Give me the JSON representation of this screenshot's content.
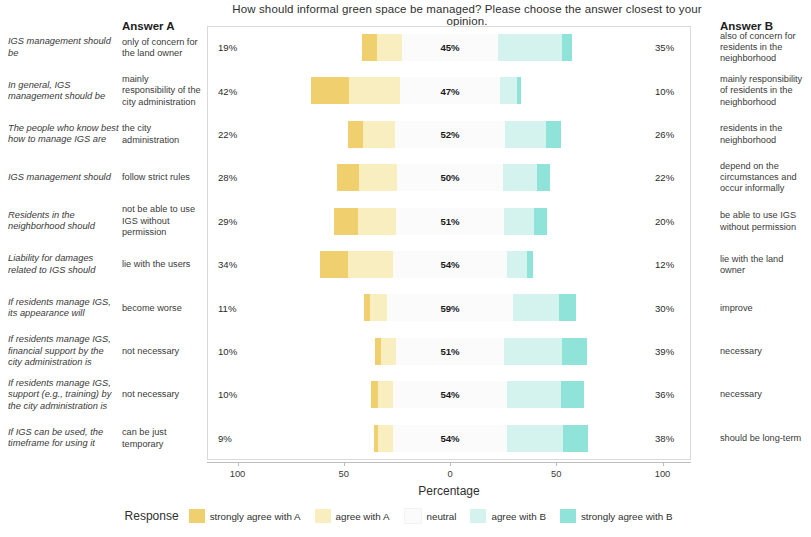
{
  "chart_data": {
    "type": "bar",
    "subtype": "diverging-stacked-likert",
    "title": "How should informal green space be managed? Please choose the answer closest to your opinion.",
    "xlabel": "Percentage",
    "ylabel": "",
    "xlim": [
      -110,
      110
    ],
    "xticks": [
      -100,
      -50,
      0,
      50,
      100
    ],
    "xticklabels": [
      "100",
      "50",
      "0",
      "50",
      "100"
    ],
    "grid": false,
    "legend_title": "Response",
    "legend_position": "bottom",
    "series": [
      {
        "name": "strongly agree with A",
        "color": "#f0cf6f"
      },
      {
        "name": "agree with A",
        "color": "#f8eec0"
      },
      {
        "name": "neutral",
        "color": "#fbfbfb"
      },
      {
        "name": "agree with B",
        "color": "#d4f2ee"
      },
      {
        "name": "strongly agree with B",
        "color": "#8fe3d8"
      }
    ],
    "column_headers": {
      "left": "Answer A",
      "right": "Answer B"
    },
    "rows": [
      {
        "statement": "IGS management should be",
        "answer_a": "only of concern for the land owner",
        "answer_b": "also of concern for residents in the neighborhood",
        "pct_a": "19%",
        "pct_neutral": "45%",
        "pct_b": "35%",
        "v_strongly_a": 7,
        "v_agree_a": 12,
        "v_neutral": 45,
        "v_agree_b": 30,
        "v_strongly_b": 5
      },
      {
        "statement": "In general, IGS management should be",
        "answer_a": "mainly responsibility of the city administration",
        "answer_b": "mainly responsibility of residents in the neighborhood",
        "pct_a": "42%",
        "pct_neutral": "47%",
        "pct_b": "10%",
        "v_strongly_a": 18,
        "v_agree_a": 24,
        "v_neutral": 47,
        "v_agree_b": 8,
        "v_strongly_b": 2
      },
      {
        "statement": "The people who know best how to manage IGS are",
        "answer_a": "the city administration",
        "answer_b": "residents in the neighborhood",
        "pct_a": "22%",
        "pct_neutral": "52%",
        "pct_b": "26%",
        "v_strongly_a": 7,
        "v_agree_a": 15,
        "v_neutral": 52,
        "v_agree_b": 19,
        "v_strongly_b": 7
      },
      {
        "statement": "IGS management should",
        "answer_a": "follow strict rules",
        "answer_b": "depend on the circumstances and occur informally",
        "pct_a": "28%",
        "pct_neutral": "50%",
        "pct_b": "22%",
        "v_strongly_a": 10,
        "v_agree_a": 18,
        "v_neutral": 50,
        "v_agree_b": 16,
        "v_strongly_b": 6
      },
      {
        "statement": "Residents in the neighborhood should",
        "answer_a": "not be able to use IGS without permission",
        "answer_b": "be able to use IGS without permission",
        "pct_a": "29%",
        "pct_neutral": "51%",
        "pct_b": "20%",
        "v_strongly_a": 11,
        "v_agree_a": 18,
        "v_neutral": 51,
        "v_agree_b": 14,
        "v_strongly_b": 6
      },
      {
        "statement": "Liability for damages related to IGS should",
        "answer_a": "lie with the users",
        "answer_b": "lie with the land owner",
        "pct_a": "34%",
        "pct_neutral": "54%",
        "pct_b": "12%",
        "v_strongly_a": 13,
        "v_agree_a": 21,
        "v_neutral": 54,
        "v_agree_b": 9,
        "v_strongly_b": 3
      },
      {
        "statement": "If residents manage IGS, its appearance will",
        "answer_a": "become worse",
        "answer_b": "improve",
        "pct_a": "11%",
        "pct_neutral": "59%",
        "pct_b": "30%",
        "v_strongly_a": 3,
        "v_agree_a": 8,
        "v_neutral": 59,
        "v_agree_b": 22,
        "v_strongly_b": 8
      },
      {
        "statement": "If residents manage IGS, financial support by the city administration is",
        "answer_a": "not necessary",
        "answer_b": "necessary",
        "pct_a": "10%",
        "pct_neutral": "51%",
        "pct_b": "39%",
        "v_strongly_a": 3,
        "v_agree_a": 7,
        "v_neutral": 51,
        "v_agree_b": 27,
        "v_strongly_b": 12
      },
      {
        "statement": "If residents manage IGS, support (e.g., training) by the city administration is",
        "answer_a": "not necessary",
        "answer_b": "necessary",
        "pct_a": "10%",
        "pct_neutral": "54%",
        "pct_b": "36%",
        "v_strongly_a": 3,
        "v_agree_a": 7,
        "v_neutral": 54,
        "v_agree_b": 25,
        "v_strongly_b": 11
      },
      {
        "statement": "If IGS can be used, the timeframe for using it",
        "answer_a": "can be just temporary",
        "answer_b": "should be long-term",
        "pct_a": "9%",
        "pct_neutral": "54%",
        "pct_b": "38%",
        "v_strongly_a": 2,
        "v_agree_a": 7,
        "v_neutral": 54,
        "v_agree_b": 26,
        "v_strongly_b": 12
      }
    ]
  }
}
